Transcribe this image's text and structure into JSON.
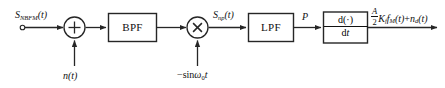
{
  "diagram": {
    "stroke_color": "#262626",
    "background_color": "#ffffff",
    "input_terminal": {
      "name": "input-terminal",
      "label_parts": {
        "base": "S",
        "subscript": "NBFM",
        "arg": "(t)"
      },
      "label_text": "S_NBFM(t)"
    },
    "noise_input": {
      "label_parts": {
        "base": "n",
        "arg": "(t)"
      },
      "label_text": "n(t)"
    },
    "summer": {
      "name": "summing-junction",
      "symbol": "+"
    },
    "bpf": {
      "name": "bandpass-filter-block",
      "label": "BPF"
    },
    "multiplier": {
      "name": "multiplier-block",
      "symbol": "×"
    },
    "local_oscillator": {
      "label_parts": {
        "sign": "−",
        "fn": "sin",
        "omega": "ω",
        "subscript": "0",
        "arg": "t"
      },
      "label_text": "−sin ω0t"
    },
    "mixer_output": {
      "label_parts": {
        "base": "S",
        "subscript": "np",
        "arg": "(t)"
      },
      "label_text": "S_np(t)"
    },
    "lpf": {
      "name": "lowpass-filter-block",
      "label": "LPF"
    },
    "lpf_output": {
      "label_text": "P"
    },
    "differentiator": {
      "name": "differentiator-block",
      "numerator": "d(·)",
      "denominator_d": "d",
      "denominator_t": "t"
    },
    "output": {
      "name": "output-signal",
      "coefficient_numerator": "A",
      "coefficient_denominator": "2",
      "gain": "K",
      "gain_subscript": "f",
      "message": "f",
      "message_subscript": "M",
      "message_arg": "(t)",
      "plus": "+",
      "noise": "n",
      "noise_subscript": "d",
      "noise_arg": "(t)",
      "label_text": "(A/2)K_f f_M(t)+n_d(t)"
    }
  }
}
